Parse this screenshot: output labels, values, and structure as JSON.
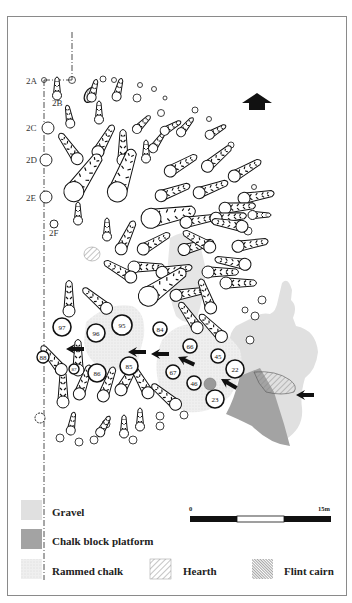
{
  "figure": {
    "type": "archaeological site plan",
    "north_arrow": "up-arrow"
  },
  "grid_labels": [
    "2A",
    "2B",
    "2C",
    "2D",
    "2E",
    "2F"
  ],
  "numbered_features": [
    "97",
    "88",
    "96",
    "95",
    "84",
    "86",
    "85",
    "87",
    "67",
    "66",
    "45",
    "46",
    "22",
    "23"
  ],
  "legend": {
    "items": [
      {
        "label": "Gravel",
        "color": "#e0e0e0",
        "swatch": "solid-light"
      },
      {
        "label": "Chalk block platform",
        "color": "#a3a3a3",
        "swatch": "solid-dark"
      },
      {
        "label": "Rammed chalk",
        "color": "#ececec",
        "swatch": "stipple"
      },
      {
        "label": "Hearth",
        "color": "#9a9a9a",
        "swatch": "diagonal-hatch"
      },
      {
        "label": "Flint cairn",
        "color": "#555555",
        "swatch": "dense-hatch"
      }
    ]
  },
  "scale_bar": {
    "start_label": "0",
    "end_label": "15m",
    "segments": [
      "black",
      "white",
      "black"
    ]
  },
  "colors": {
    "frame": "#8a8a8a",
    "gravel": "#e0e0e0",
    "platform": "#a3a3a3",
    "rammed": "#e8e8e8",
    "ink": "#111111"
  }
}
